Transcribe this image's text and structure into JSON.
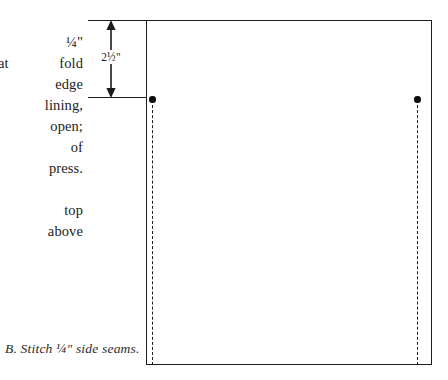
{
  "figure": {
    "caption": "B. Stitch ¼\" side seams.",
    "dimension_label": "2½\"",
    "dimension_unit": "inches",
    "dimension_value": "2.5"
  },
  "body_text": {
    "lines": [
      "rectangle",
      "titch ¼\"",
      "g at fold",
      "aw edge",
      "n lining,",
      "ms open;",
      "ction of",
      "t; press.",
      "atching.",
      "rom top",
      "\" above"
    ]
  },
  "diagram": {
    "shape": "rectangle",
    "seam_left_label": "left side seam",
    "seam_right_label": "right side seam",
    "dot_left_label": "left stitch start point",
    "dot_right_label": "right stitch start point"
  },
  "colors": {
    "ink": "#1b1b1b",
    "text": "#222222",
    "paper": "#ffffff",
    "dot": "#0d0d0d"
  }
}
